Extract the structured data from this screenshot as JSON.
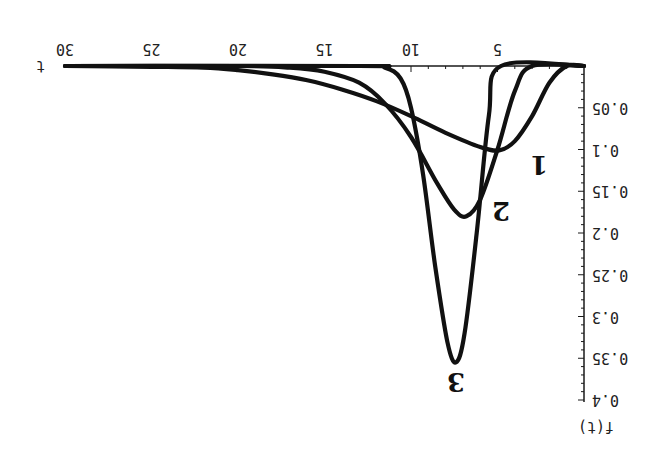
{
  "chart_data": {
    "type": "line",
    "orientation_note": "figure printed rotated 180 degrees",
    "title": "",
    "xlabel": "t",
    "ylabel": "f(t)",
    "xlim": [
      0,
      30
    ],
    "ylim": [
      0,
      0.4
    ],
    "xticks": [
      5,
      10,
      15,
      20,
      25,
      30
    ],
    "yticks": [
      0.05,
      0.1,
      0.15,
      0.2,
      0.25,
      0.3,
      0.35,
      0.4
    ],
    "ytick_labels": [
      "0.05",
      "0.1",
      "0.15",
      "0.2",
      "0.25",
      "0.3",
      "0.35",
      "0.4"
    ],
    "grid": false,
    "series": [
      {
        "name": "1",
        "label": "1",
        "peak_t": 4.9,
        "peak_f": 0.101,
        "onset_t": 1.0,
        "points": [
          [
            0,
            0
          ],
          [
            1,
            0
          ],
          [
            2,
            0.02
          ],
          [
            3,
            0.06
          ],
          [
            4,
            0.09
          ],
          [
            4.9,
            0.101
          ],
          [
            6,
            0.097
          ],
          [
            8,
            0.08
          ],
          [
            10,
            0.06
          ],
          [
            12,
            0.042
          ],
          [
            14,
            0.028
          ],
          [
            16,
            0.017
          ],
          [
            18,
            0.01
          ],
          [
            20,
            0.005
          ],
          [
            22,
            0.002
          ],
          [
            25,
            0.001
          ],
          [
            30,
            0
          ]
        ]
      },
      {
        "name": "2",
        "label": "2",
        "peak_t": 6.8,
        "peak_f": 0.18,
        "onset_t": 3.0,
        "points": [
          [
            0,
            0
          ],
          [
            3,
            0
          ],
          [
            4,
            0.03
          ],
          [
            5,
            0.1
          ],
          [
            6,
            0.16
          ],
          [
            6.8,
            0.18
          ],
          [
            7.5,
            0.172
          ],
          [
            8.5,
            0.14
          ],
          [
            10,
            0.085
          ],
          [
            11.5,
            0.045
          ],
          [
            13,
            0.02
          ],
          [
            15,
            0.007
          ],
          [
            17,
            0.002
          ],
          [
            20,
            0
          ],
          [
            30,
            0
          ]
        ]
      },
      {
        "name": "3",
        "label": "3",
        "peak_t": 7.4,
        "peak_f": 0.355,
        "onset_t": 4.8,
        "points": [
          [
            0,
            0
          ],
          [
            4.8,
            0
          ],
          [
            5.5,
            0.06
          ],
          [
            6.2,
            0.2
          ],
          [
            6.9,
            0.32
          ],
          [
            7.4,
            0.355
          ],
          [
            7.9,
            0.33
          ],
          [
            8.6,
            0.24
          ],
          [
            9.3,
            0.13
          ],
          [
            10,
            0.05
          ],
          [
            10.6,
            0.015
          ],
          [
            11.5,
            0.002
          ],
          [
            13,
            0
          ],
          [
            30,
            0
          ]
        ]
      }
    ],
    "curve_labels": [
      {
        "text": "1",
        "t": 2.6,
        "f": 0.12
      },
      {
        "text": "2",
        "t": 4.8,
        "f": 0.175
      },
      {
        "text": "3",
        "t": 7.4,
        "f": 0.38
      }
    ]
  }
}
